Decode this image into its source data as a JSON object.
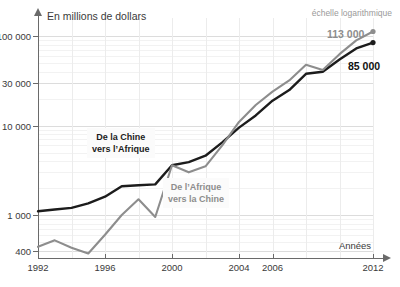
{
  "axis_title_y": "En millions de dollars",
  "axis_title_x": "Années",
  "scale_note": "échelle logarithmique",
  "clipped_title": "",
  "labels": {
    "series_black": "De la Chine\nvers l’Afrique",
    "series_black_line1": "De la Chine",
    "series_black_line2": "vers l’Afrique",
    "series_grey_line1": "De l’Afrique",
    "series_grey_line2": "vers la Chine",
    "end_grey": "113 000",
    "end_black": "85 000"
  },
  "colors": {
    "series_black": "#1c1c1c",
    "series_grey": "#8d8d8d",
    "axis": "#6a6a6a",
    "grid": "#e9e9e9",
    "background": "#ffffff"
  },
  "chart_data": {
    "type": "line",
    "title": "",
    "xlabel": "Années",
    "ylabel": "En millions de dollars",
    "yscale": "log",
    "ylim": [
      330,
      160000
    ],
    "xlim": [
      1992,
      2012
    ],
    "grid": true,
    "legend": "inline-callouts",
    "ytick_labels": [
      "400",
      "1 000",
      "10 000",
      "30 000",
      "100 000"
    ],
    "ytick_values": [
      400,
      1000,
      10000,
      30000,
      100000
    ],
    "xtick_labels": [
      "1992",
      "1996",
      "2000",
      "2004",
      "2006",
      "2012"
    ],
    "xtick_values": [
      1992,
      1996,
      2000,
      2004,
      2006,
      2012
    ],
    "x": [
      1992,
      1993,
      1994,
      1995,
      1996,
      1997,
      1998,
      1999,
      2000,
      2001,
      2002,
      2003,
      2004,
      2005,
      2006,
      2007,
      2008,
      2009,
      2010,
      2011,
      2012
    ],
    "series": [
      {
        "name": "De la Chine vers l’Afrique",
        "color": "#1c1c1c",
        "end_label": "85 000",
        "values": [
          1100,
          1150,
          1200,
          1350,
          1600,
          2100,
          2150,
          2200,
          3600,
          3900,
          4600,
          6500,
          9500,
          13000,
          19000,
          25000,
          38000,
          40000,
          55000,
          73000,
          85000
        ]
      },
      {
        "name": "De l’Afrique vers la Chine",
        "color": "#8d8d8d",
        "end_label": "113 000",
        "values": [
          440,
          520,
          430,
          370,
          600,
          1000,
          1500,
          950,
          3600,
          3000,
          3500,
          6000,
          11000,
          17000,
          24000,
          32000,
          48000,
          42000,
          63000,
          90000,
          113000
        ]
      }
    ],
    "annotations": [
      {
        "text": "113 000",
        "series": "De l’Afrique vers la Chine",
        "x": 2012,
        "y": 113000
      },
      {
        "text": "85 000",
        "series": "De la Chine vers l’Afrique",
        "x": 2012,
        "y": 85000
      },
      {
        "text": "échelle logarithmique",
        "position": "top-right"
      }
    ]
  }
}
